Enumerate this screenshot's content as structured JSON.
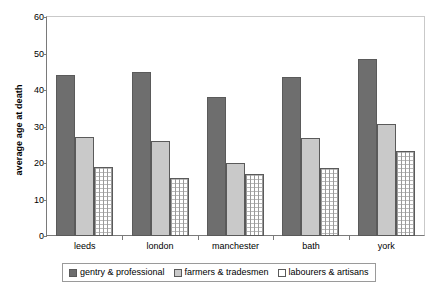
{
  "chart_data": {
    "type": "bar",
    "title": "",
    "xlabel": "",
    "ylabel": "average age at death",
    "ylim": [
      0,
      60
    ],
    "yticks": [
      0,
      10,
      20,
      30,
      40,
      50,
      60
    ],
    "ytick_labels": [
      "0",
      "10",
      "20",
      "30",
      "40",
      "50",
      "60"
    ],
    "grid": false,
    "legend_position": "bottom",
    "categories": [
      "leeds",
      "london",
      "manchester",
      "bath",
      "york"
    ],
    "series": [
      {
        "name": "gentry & professional",
        "color": "#6e6e6e",
        "values": [
          44,
          45,
          38,
          43.5,
          48.5
        ]
      },
      {
        "name": "farmers & tradesmen",
        "color": "#c9c9c9",
        "values": [
          27,
          26,
          20,
          26.8,
          30.7
        ]
      },
      {
        "name": "labourers & artisans",
        "color": "#ffffff",
        "values": [
          19,
          16,
          17,
          18.7,
          23.3
        ]
      }
    ]
  },
  "legend": {
    "items": [
      {
        "label": "gentry & professional"
      },
      {
        "label": "farmers & tradesmen"
      },
      {
        "label": "labourers & artisans"
      }
    ]
  }
}
